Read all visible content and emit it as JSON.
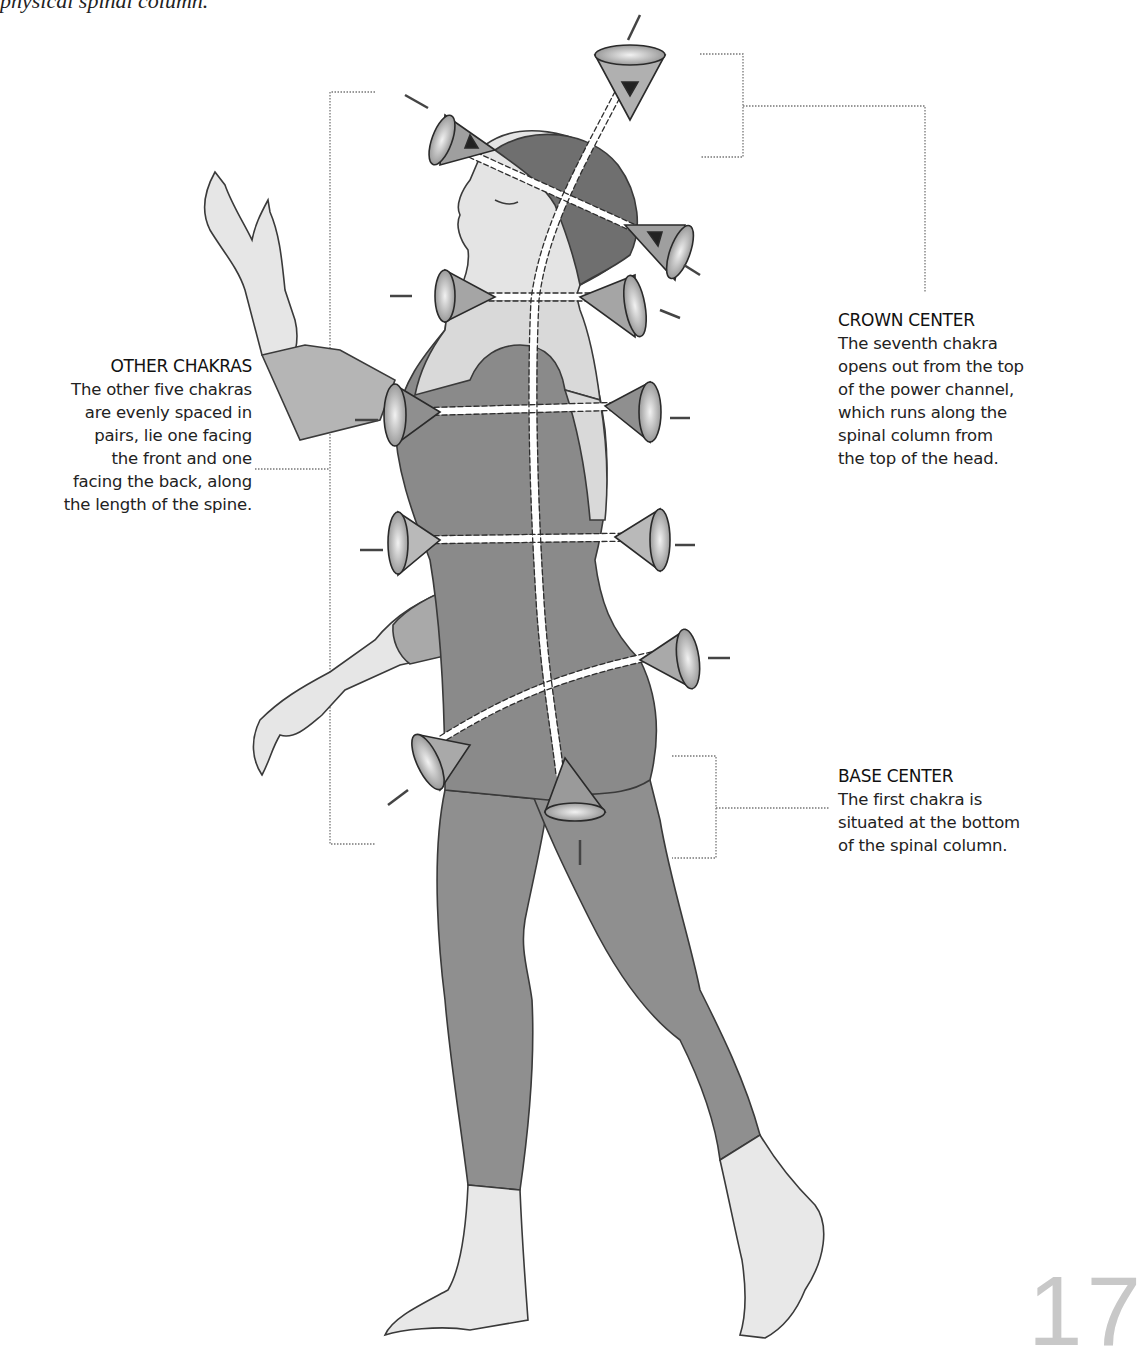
{
  "intro_text": "physical spinal column.",
  "captions": {
    "other": {
      "heading": "OTHER CHAKRAS",
      "lines": [
        "The other five chakras",
        "are evenly spaced in",
        "pairs, lie one facing",
        "the front and one",
        "facing the back, along",
        "the length of the spine."
      ]
    },
    "crown": {
      "heading": "CROWN CENTER",
      "lines": [
        "The seventh chakra",
        "opens out from the top",
        "of the power channel,",
        "which runs along the",
        "spinal column from",
        "the top of the head."
      ]
    },
    "base": {
      "heading": "BASE CENTER",
      "lines": [
        "The first chakra is",
        "situated at the bottom",
        "of the spinal column."
      ]
    }
  },
  "page_number": "17",
  "colors": {
    "body_fill": "#8c8c8c",
    "skin_fill": "#e2e2e2",
    "outline": "#3a3a3a",
    "leader_line": "#777777"
  }
}
